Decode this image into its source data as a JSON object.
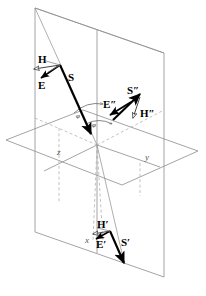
{
  "figure": {
    "type": "optics-vector-diagram",
    "background_color": "#ffffff",
    "line_color": "#888888",
    "vector_color": "#000000",
    "dashed_color": "#aaaaaa"
  },
  "axes": [
    {
      "name": "x-axis",
      "label": "x",
      "x": 86,
      "y": 239
    },
    {
      "name": "y-axis",
      "label": "y",
      "x": 147,
      "y": 157
    },
    {
      "name": "z-axis",
      "label": "z",
      "x": 59,
      "y": 152
    }
  ],
  "angles": [
    {
      "name": "angle-of-incidence",
      "label": "φ",
      "x": 78,
      "y": 117
    },
    {
      "name": "angle-of-reflection",
      "label": "φ",
      "x": 94,
      "y": 125
    }
  ],
  "vectors": {
    "incident": [
      {
        "name": "poynting-vector-incident",
        "label": "S",
        "x": 68,
        "y": 78
      },
      {
        "name": "electric-field-incident",
        "label": "E",
        "x": 41,
        "y": 85
      },
      {
        "name": "magnetic-field-incident",
        "label": "H",
        "x": 41,
        "y": 63
      }
    ],
    "reflected": [
      {
        "name": "poynting-vector-reflected",
        "label": "S″",
        "x": 128,
        "y": 92
      },
      {
        "name": "electric-field-reflected",
        "label": "E″",
        "x": 105,
        "y": 105
      },
      {
        "name": "magnetic-field-reflected",
        "label": "H″",
        "x": 142,
        "y": 114
      }
    ],
    "transmitted": [
      {
        "name": "poynting-vector-transmitted",
        "label": "S′",
        "x": 123,
        "y": 243
      },
      {
        "name": "electric-field-transmitted",
        "label": "E′",
        "x": 99,
        "y": 245
      },
      {
        "name": "magnetic-field-transmitted",
        "label": "H′",
        "x": 99,
        "y": 226
      }
    ]
  }
}
